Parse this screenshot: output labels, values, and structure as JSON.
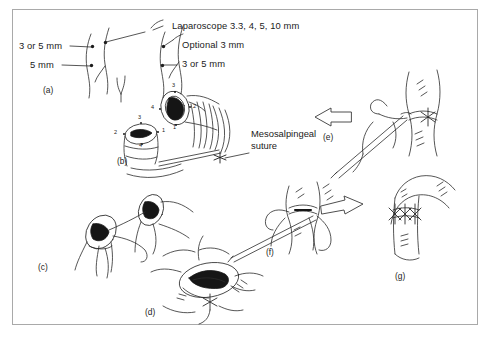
{
  "figure": {
    "caption_labels": {
      "laparoscope": "Laparoscope 3.3, 4, 5, 10 mm",
      "optional": "Optional 3 mm",
      "port_right": "3 or 5 mm",
      "port_left_upper": "3 or 5 mm",
      "port_left_lower": "5 mm",
      "mesosalpingeal_line1": "Mesosalpingeal",
      "mesosalpingeal_line2": "suture"
    },
    "panels": [
      {
        "id": "(a)",
        "name": "trocar-port-placement"
      },
      {
        "id": "(b)",
        "name": "tubal-stumps-mesosalpingeal-suture"
      },
      {
        "id": "(c)",
        "name": "stumps-approximated-sutures"
      },
      {
        "id": "(d)",
        "name": "anastomosis-lumen-alignment"
      },
      {
        "id": "(e)",
        "name": "instrument-traction-left"
      },
      {
        "id": "(f)",
        "name": "instrument-traction-right"
      },
      {
        "id": "(g)",
        "name": "completed-anastomosis"
      }
    ],
    "suture_markers": [
      "1",
      "2",
      "3",
      "4"
    ],
    "colors": {
      "ink": "#1b1b1b",
      "frame": "#a9a9a9",
      "background": "#ffffff",
      "lumen": "#111111"
    }
  }
}
